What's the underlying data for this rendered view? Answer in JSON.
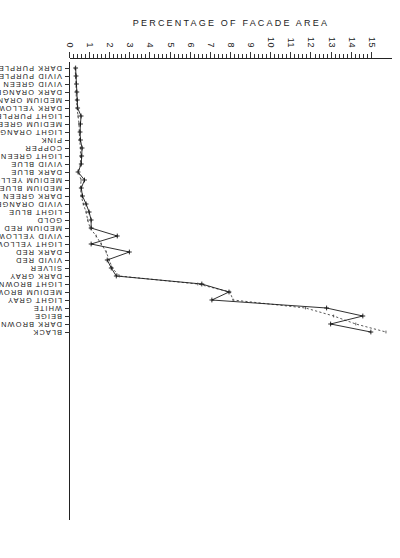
{
  "chart_data": {
    "type": "line",
    "title": "",
    "xlabel": "PERCENTAGE OF FACADE AREA",
    "ylabel": "COLOR CATEGORIES",
    "orientation": "horizontal-rotated",
    "xlim": [
      0,
      16
    ],
    "xticks": [
      0,
      1,
      2,
      3,
      4,
      5,
      6,
      7,
      8,
      9,
      10,
      11,
      12,
      13,
      14,
      15
    ],
    "xticklabels": [
      "0",
      "1",
      "2",
      "3",
      "4",
      "5",
      "6",
      "7",
      "8",
      "9",
      "10",
      "11",
      "12",
      "13",
      "14",
      "15"
    ],
    "minor_ticks": true,
    "grid": false,
    "legend": "none",
    "categories": [
      "DARK PURPLE",
      "VIVID PURPLE",
      "VIVID GREEN",
      "DARK ORANGE",
      "MEDIUM ORANGE",
      "DARK YELLOW",
      "LIGHT PURPLE",
      "MEDIUM GREEN",
      "LIGHT ORANGE",
      "PINK",
      "COPPER",
      "LIGHT GREEN",
      "VIVID BLUE",
      "DARK BLUE",
      "MEDIUM YELLOW",
      "MEDIUM BLUE",
      "DARK GREEN",
      "VIVID ORANGE",
      "LIGHT BLUE",
      "GOLD",
      "MEDIUM RED",
      "VIVID YELLOW",
      "LIGHT YELLOW",
      "DARK RED",
      "VIVID RED",
      "SILVER",
      "DARK GRAY",
      "LIGHT BROWN",
      "MEDIUM BROWN",
      "LIGHT GRAY",
      "WHITE",
      "BEIGE",
      "DARK BROWN",
      "BLACK"
    ],
    "series": [
      {
        "name": "solid-series",
        "style": "solid-with-plus-markers",
        "values": [
          0.28,
          0.3,
          0.32,
          0.34,
          0.36,
          0.38,
          0.55,
          0.52,
          0.5,
          0.52,
          0.6,
          0.58,
          0.56,
          0.4,
          0.72,
          0.56,
          0.62,
          0.8,
          0.95,
          1.05,
          1.05,
          2.35,
          1.05,
          2.95,
          1.85,
          2.05,
          2.3,
          6.55,
          7.9,
          7.05,
          12.75,
          14.55,
          12.95,
          14.95
        ]
      },
      {
        "name": "dotted-series",
        "style": "dotted",
        "values": [
          0.25,
          0.28,
          0.3,
          0.3,
          0.32,
          0.35,
          0.4,
          0.45,
          0.46,
          0.48,
          0.52,
          0.52,
          0.52,
          0.42,
          0.55,
          0.52,
          0.56,
          0.66,
          0.8,
          0.88,
          1.0,
          1.3,
          1.55,
          1.8,
          1.95,
          2.1,
          2.45,
          6.35,
          7.95,
          8.1,
          11.7,
          13.1,
          14.2,
          15.7
        ]
      }
    ]
  }
}
